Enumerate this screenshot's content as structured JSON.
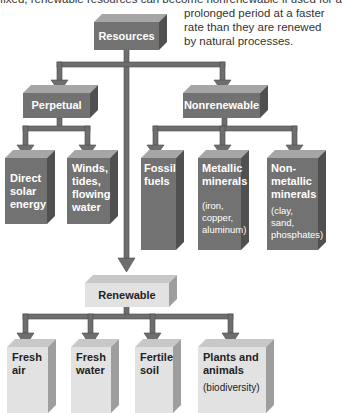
{
  "captions": {
    "top_cut": "fixed, renewable resources can become nonrenewable if used for a",
    "right": "prolonged period at a faster rate than they are renewed by natural processes."
  },
  "diagram": {
    "root": "Resources",
    "branches": {
      "perpetual": {
        "label": "Perpetual",
        "children": [
          "Direct solar energy",
          "Winds, tides, flowing water"
        ]
      },
      "nonrenewable": {
        "label": "Nonrenewable",
        "children": [
          {
            "label": "Fossil fuels",
            "note": ""
          },
          {
            "label": "Metallic minerals",
            "note": "(iron, copper, aluminum)"
          },
          {
            "label": "Non-metallic minerals",
            "note": "(clay, sand, phosphates)"
          }
        ]
      },
      "renewable": {
        "label": "Renewable",
        "children": [
          {
            "label": "Fresh air",
            "note": ""
          },
          {
            "label": "Fresh water",
            "note": ""
          },
          {
            "label": "Fertile soil",
            "note": ""
          },
          {
            "label": "Plants and animals",
            "note": "(biodiversity)"
          }
        ]
      }
    }
  },
  "colors": {
    "dark_box": "#727272",
    "light_box": "#e2e2e2",
    "connector": "#6e6e6e"
  }
}
